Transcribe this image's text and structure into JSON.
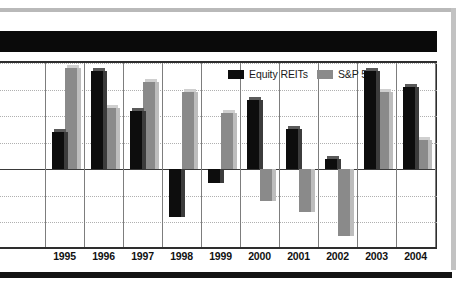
{
  "title_bar": {
    "redacted": true,
    "text": ""
  },
  "legend": {
    "position": "top-right",
    "entries": [
      {
        "label": "Equity REITs",
        "color": "#0d0d0d",
        "icon": "legend-swatch-black"
      },
      {
        "label": "S&P 500",
        "color": "#8a8a8a",
        "icon": "legend-swatch-gray"
      }
    ]
  },
  "chart_data": {
    "type": "bar",
    "title": "",
    "subtitle": "",
    "xlabel": "",
    "ylabel": "",
    "grid": true,
    "legend_position": "top-right",
    "ylim": [
      -30,
      40
    ],
    "yticks": [
      -30,
      -20,
      -10,
      0,
      10,
      20,
      30,
      40
    ],
    "categories": [
      "1995",
      "1996",
      "1997",
      "1998",
      "1999",
      "2000",
      "2001",
      "2002",
      "2003",
      "2004"
    ],
    "series": [
      {
        "name": "Equity REITs",
        "color": "#0d0d0d",
        "values": [
          14,
          37,
          22,
          -18,
          -5,
          26,
          15,
          4,
          37,
          31
        ]
      },
      {
        "name": "S&P 500",
        "color": "#8a8a8a",
        "values": [
          38,
          23,
          33,
          29,
          21,
          -12,
          -16,
          -25,
          29,
          11
        ]
      }
    ]
  },
  "xaxis": {
    "tick_labels": [
      "1995",
      "1996",
      "1997",
      "1998",
      "1999",
      "2000",
      "2001",
      "2002",
      "2003",
      "2004"
    ]
  }
}
